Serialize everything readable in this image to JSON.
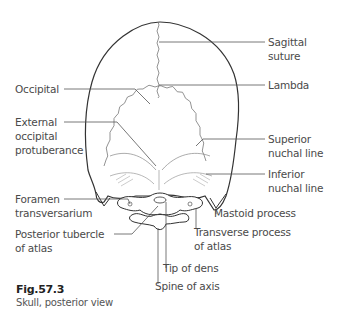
{
  "figure": {
    "number": "Fig.57.3",
    "caption": "Skull, posterior view"
  },
  "labels": {
    "sagittal_suture_1": "Sagittal",
    "sagittal_suture_2": "suture",
    "lambda": "Lambda",
    "occipital": "Occipital",
    "ext_occ_1": "External",
    "ext_occ_2": "occipital",
    "ext_occ_3": "protuberance",
    "superior_nuchal_1": "Superior",
    "superior_nuchal_2": "nuchal line",
    "inferior_nuchal_1": "Inferior",
    "inferior_nuchal_2": "nuchal line",
    "mastoid": "Mastoid process",
    "foramen_1": "Foramen",
    "foramen_2": "transversarium",
    "transverse_1": "Transverse process",
    "transverse_2": "of atlas",
    "posterior_tubercle_1": "Posterior tubercle",
    "posterior_tubercle_2": "of atlas",
    "tip_of_dens": "Tip of dens",
    "spine_of_axis": "Spine of axis"
  },
  "colors": {
    "outline": "#333333",
    "suture": "#777777",
    "leader": "#555555",
    "text": "#4a4a4a"
  }
}
